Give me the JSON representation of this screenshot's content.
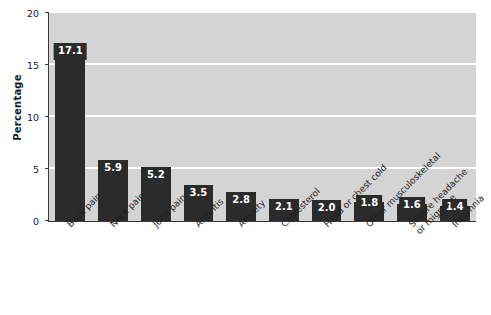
{
  "chart_data": {
    "type": "bar",
    "title": "",
    "xlabel": "",
    "ylabel": "Percentage",
    "ylim": [
      0,
      20
    ],
    "yticks": [
      0,
      5,
      10,
      15,
      20
    ],
    "ytick_labels": [
      "0",
      "5",
      "10",
      "15",
      "20"
    ],
    "gridlines": [
      5,
      10,
      15
    ],
    "grid": true,
    "legend": "none",
    "categories": [
      "Back pain",
      "Neck pain",
      "Joint pain",
      "Arthritis",
      "Anxiety",
      "Cholesterol",
      "Head or chest cold",
      "Other musculoskeletal",
      "Severe headache or migraine",
      "Insomnia"
    ],
    "values": [
      17.1,
      5.9,
      5.2,
      3.5,
      2.8,
      2.1,
      2.0,
      1.8,
      1.6,
      1.4
    ],
    "data_labels": [
      "17.1",
      "5.9",
      "5.2",
      "3.5",
      "2.8",
      "2.1",
      "2.0",
      "1.8",
      "1.6",
      "1.4"
    ],
    "bar_color": "#2b2b2b",
    "plot_background": "#d4d4d4",
    "gridline_color": "#ffffff",
    "axis_color": "#3a3a3a",
    "label_text_color": "#ffffff"
  },
  "axes": {
    "y_title": "Percentage"
  },
  "x_label_lines": [
    [
      "Back pain"
    ],
    [
      "Neck pain"
    ],
    [
      "Joint pain"
    ],
    [
      "Arthritis"
    ],
    [
      "Anxiety"
    ],
    [
      "Cholesterol"
    ],
    [
      "Head or chest cold"
    ],
    [
      "Other musculoskeletal"
    ],
    [
      "Severe headache",
      "or migraine"
    ],
    [
      "Insomnia"
    ]
  ]
}
